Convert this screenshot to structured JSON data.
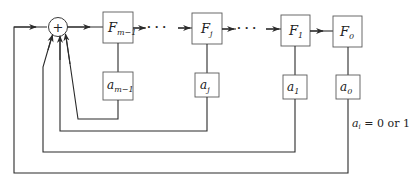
{
  "diagram": {
    "type": "linear feedback shift register",
    "adder": {
      "symbol": "+"
    },
    "stages": [
      {
        "id": "F_m-1",
        "label_base": "F",
        "label_sub": "m−1",
        "coef_base": "a",
        "coef_sub": "m−1"
      },
      {
        "id": "F_j",
        "label_base": "F",
        "label_sub": "j",
        "coef_base": "a",
        "coef_sub": "j"
      },
      {
        "id": "F_1",
        "label_base": "F",
        "label_sub": "1",
        "coef_base": "a",
        "coef_sub": "1"
      },
      {
        "id": "F_0",
        "label_base": "F",
        "label_sub": "0",
        "coef_base": "a",
        "coef_sub": "0"
      }
    ],
    "ellipsis": "· · ·",
    "note": {
      "var_base": "a",
      "var_sub": "i",
      "text": " = 0 or 1"
    }
  },
  "colors": {
    "line": "#2a2a2a",
    "box_border": "#5a5a5a",
    "background": "#ffffff"
  }
}
